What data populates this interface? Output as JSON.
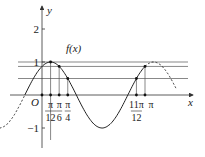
{
  "diagram": {
    "function_label": "f(x)",
    "function_expr": "sin(2x + π/3)",
    "axis_labels": {
      "x": "x",
      "y": "y",
      "origin": "O"
    },
    "y_ticks": [
      {
        "value": 2,
        "label": "2"
      },
      {
        "value": 1,
        "label": "1"
      },
      {
        "value": -1,
        "label": "-1"
      }
    ],
    "x_marks": [
      {
        "value_over_pi": 0.08333,
        "num": "π",
        "den": "12"
      },
      {
        "value_over_pi": 0.16667,
        "num": "π",
        "den": "6"
      },
      {
        "value_over_pi": 0.25,
        "num": "π",
        "den": "4"
      },
      {
        "value_over_pi": 0.91667,
        "num": "11π",
        "den": "12"
      },
      {
        "value_over_pi": 1.0,
        "num": "π",
        "den": ""
      }
    ],
    "horizontal_levels": [
      1,
      0.866,
      0.5
    ],
    "solid_range_over_pi": [
      -0.1667,
      1.0
    ],
    "dashed_ranges_over_pi": [
      [
        -0.45,
        -0.1667
      ],
      [
        1.0,
        1.3
      ]
    ],
    "colors": {
      "stroke": "#333333",
      "text": "#222222"
    }
  }
}
